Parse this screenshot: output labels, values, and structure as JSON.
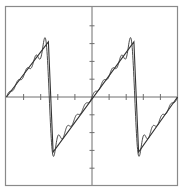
{
  "chart_data": {
    "type": "line",
    "title": "",
    "xlabel": "",
    "ylabel": "",
    "grid": false,
    "legend": null,
    "xlim": [
      -1,
      1
    ],
    "ylim": [
      -1,
      1
    ],
    "x_ticks_per_half_axis": 4,
    "y_ticks_per_half_axis": 4,
    "periods_shown": 2,
    "discontinuities_x": [
      -0.5,
      0.5
    ],
    "series": [
      {
        "name": "sawtooth",
        "style": "straight",
        "description": "Ideal sawtooth: y rises linearly from -A to +A across each period, then drops",
        "amplitude": 0.62
      },
      {
        "name": "fourier-approximation",
        "style": "wiggly",
        "harmonics": 9,
        "description": "Partial Fourier sum with ripple and ~9% overshoot near jumps",
        "peak_overshoot": 0.68
      }
    ],
    "colors": {
      "frame": "#8a8a8a",
      "axes": "#6e6e6e",
      "curve": "#333333",
      "background": "#ffffff"
    }
  }
}
